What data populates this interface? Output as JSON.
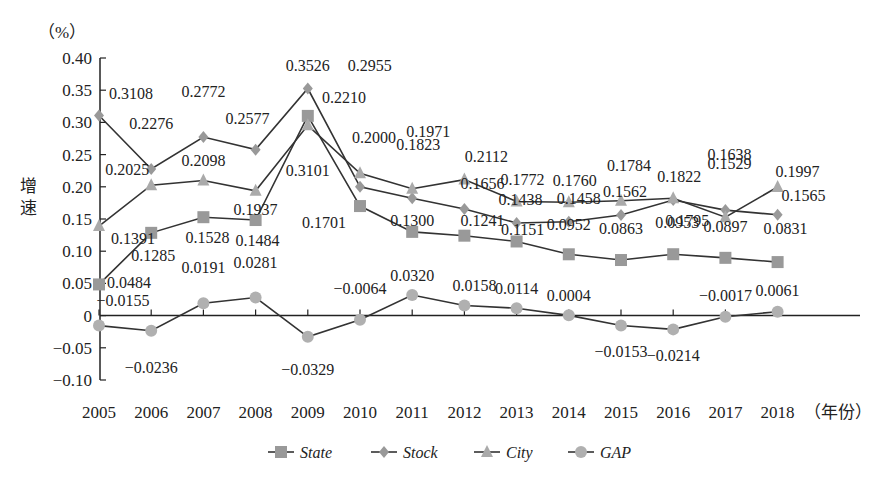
{
  "chart_data": {
    "type": "line",
    "title": "",
    "ylabel": "增速",
    "y_unit": "（%）",
    "x_unit": "（年份）",
    "ylim": [
      -0.1,
      0.4
    ],
    "yticks": [
      "-0.10",
      "-0.05",
      "0",
      "0.05",
      "0.10",
      "0.15",
      "0.20",
      "0.25",
      "0.30",
      "0.35",
      "0.40"
    ],
    "grid": false,
    "legend_position": "bottom",
    "categories": [
      "2005",
      "2006",
      "2007",
      "2008",
      "2009",
      "2010",
      "2011",
      "2012",
      "2013",
      "2014",
      "2015",
      "2016",
      "2017",
      "2018"
    ],
    "series": [
      {
        "name": "State",
        "marker": "square",
        "color": "#999999",
        "values": [
          0.0484,
          0.1285,
          0.1528,
          0.1484,
          0.3101,
          0.1701,
          0.13,
          0.1241,
          0.1151,
          0.0952,
          0.0863,
          0.0953,
          0.0897,
          0.0831
        ]
      },
      {
        "name": "Stock",
        "marker": "diamond",
        "color": "#999999",
        "values": [
          0.3108,
          0.2276,
          0.2772,
          0.2577,
          0.3526,
          0.2,
          0.1823,
          0.1656,
          0.1438,
          0.1458,
          0.1562,
          0.1795,
          0.1638,
          0.1565
        ]
      },
      {
        "name": "City",
        "marker": "triangle",
        "color": "#aaaaaa",
        "values": [
          0.1391,
          0.2025,
          0.2098,
          0.1937,
          0.2955,
          0.221,
          0.1971,
          0.2112,
          0.1772,
          0.176,
          0.1784,
          0.1822,
          0.1529,
          0.1997
        ]
      },
      {
        "name": "GAP",
        "marker": "circle",
        "color": "#b0b0b0",
        "values": [
          -0.0155,
          -0.0236,
          0.0191,
          0.0281,
          -0.0329,
          -0.0064,
          0.032,
          0.0158,
          0.0114,
          0.0004,
          -0.0153,
          -0.0214,
          -0.0017,
          0.0061
        ]
      }
    ]
  }
}
